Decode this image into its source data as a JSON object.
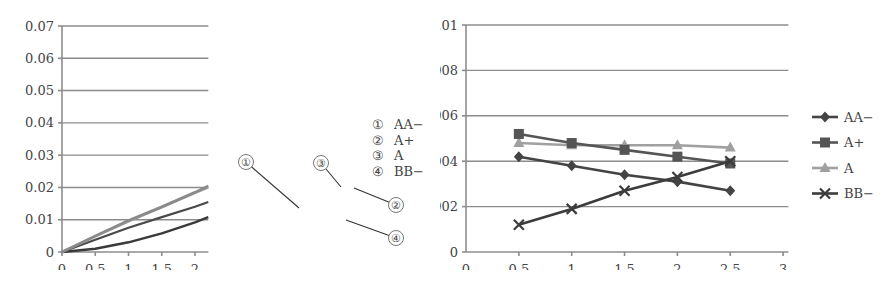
{
  "chart_data": [
    {
      "type": "line",
      "title": "",
      "xlabel": "",
      "ylabel": "",
      "xlim": [
        0,
        2.2
      ],
      "ylim": [
        0,
        0.07
      ],
      "x_ticks": [
        "0",
        "0.5",
        "1",
        "1.5",
        "2"
      ],
      "y_ticks": [
        "0",
        "0.01",
        "0.02",
        "0.03",
        "0.04",
        "0.05",
        "0.06",
        "0.07"
      ],
      "grid": "horizontal",
      "legend_position": "right",
      "legend": [
        "① AA−",
        "② A+",
        "③ A",
        "④ BB−"
      ],
      "annotations": [
        "①",
        "②",
        "③",
        "④"
      ],
      "x": [
        0,
        0.5,
        1.0,
        1.5,
        2.0,
        2.2
      ],
      "series": [
        {
          "name": "AA−",
          "marker": "①",
          "color": "#4a4a4a",
          "values": [
            0,
            0.0038,
            0.0075,
            0.0108,
            0.014,
            0.0155
          ]
        },
        {
          "name": "A+",
          "marker": "②",
          "color": "#8a8a8a",
          "values": [
            0,
            0.005,
            0.0098,
            0.014,
            0.0185,
            0.0205
          ]
        },
        {
          "name": "A",
          "marker": "③",
          "color": "#9a9a9a",
          "values": [
            0,
            0.0048,
            0.0095,
            0.0138,
            0.0183,
            0.02
          ]
        },
        {
          "name": "BB−",
          "marker": "④",
          "color": "#3a3a3a",
          "values": [
            0,
            0.001,
            0.003,
            0.0058,
            0.0092,
            0.0108
          ]
        }
      ]
    },
    {
      "type": "line",
      "title": "",
      "xlabel": "",
      "ylabel": "",
      "xlim": [
        0,
        3
      ],
      "ylim": [
        0,
        0.01
      ],
      "x_ticks": [
        "0",
        "0.5",
        "1",
        "1.5",
        "2",
        "2.5",
        "3"
      ],
      "y_ticks": [
        "0",
        "0.002",
        "0.004",
        "0.006",
        "0.008",
        "0.01"
      ],
      "grid": "horizontal",
      "legend_position": "right",
      "x": [
        0.5,
        1.0,
        1.5,
        2.0,
        2.5
      ],
      "series": [
        {
          "name": "AA−",
          "marker": "diamond",
          "color": "#444444",
          "values": [
            0.0042,
            0.0038,
            0.0034,
            0.0031,
            0.0027
          ]
        },
        {
          "name": "A+",
          "marker": "square",
          "color": "#555555",
          "values": [
            0.0052,
            0.0048,
            0.0045,
            0.0042,
            0.0039
          ]
        },
        {
          "name": "A",
          "marker": "triangle",
          "color": "#a0a0a0",
          "values": [
            0.0048,
            0.0047,
            0.0047,
            0.0047,
            0.0046
          ]
        },
        {
          "name": "BB−",
          "marker": "x",
          "color": "#3c3c3c",
          "values": [
            0.0012,
            0.0019,
            0.0027,
            0.0033,
            0.004
          ]
        }
      ]
    }
  ],
  "left_chart": {
    "y_ticks": [
      "0.07",
      "0.06",
      "0.05",
      "0.04",
      "0.03",
      "0.02",
      "0.01",
      "0"
    ],
    "x_ticks": [
      "0",
      "0.5",
      "1",
      "1.5",
      "2"
    ],
    "legend": [
      {
        "num": "①",
        "label": "AA−"
      },
      {
        "num": "②",
        "label": "A+"
      },
      {
        "num": "③",
        "label": "A"
      },
      {
        "num": "④",
        "label": "BB−"
      }
    ],
    "callouts": [
      "①",
      "②",
      "③",
      "④"
    ]
  },
  "right_chart": {
    "y_ticks": [
      "0.01",
      "0.008",
      "0.006",
      "0.004",
      "0.002",
      "0"
    ],
    "x_ticks": [
      "0",
      "0.5",
      "1",
      "1.5",
      "2",
      "2.5",
      "3"
    ],
    "legend": [
      {
        "label": "AA−"
      },
      {
        "label": "A+"
      },
      {
        "label": "A"
      },
      {
        "label": "BB−"
      }
    ]
  },
  "caption": ""
}
